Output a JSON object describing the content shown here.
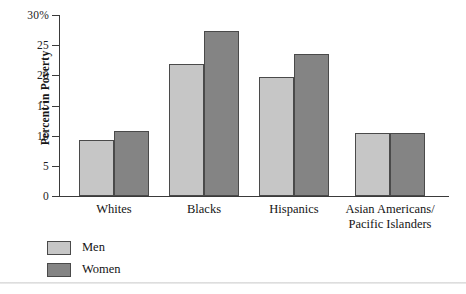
{
  "chart_data": {
    "type": "bar",
    "title": "",
    "xlabel": "",
    "ylabel": "Percent in Poverty",
    "ylim": [
      0,
      30
    ],
    "grid": false,
    "legend_position": "bottom-left",
    "y_ticks": [
      {
        "value": 30,
        "label": "30%"
      },
      {
        "value": 25,
        "label": "25"
      },
      {
        "value": 20,
        "label": "20"
      },
      {
        "value": 15,
        "label": "15"
      },
      {
        "value": 10,
        "label": "10"
      },
      {
        "value": 5,
        "label": "5"
      },
      {
        "value": 0,
        "label": "0"
      }
    ],
    "categories": [
      "Whites",
      "Blacks",
      "Hispanics",
      "Asian Americans/\nPacific Islanders"
    ],
    "category_lines": [
      [
        "Whites"
      ],
      [
        "Blacks"
      ],
      [
        "Hispanics"
      ],
      [
        "Asian Americans/",
        "Pacific Islanders"
      ]
    ],
    "series": [
      {
        "name": "Men",
        "color": "#c6c6c6",
        "values": [
          9.3,
          21.9,
          19.7,
          10.5
        ]
      },
      {
        "name": "Women",
        "color": "#848484",
        "values": [
          10.8,
          27.4,
          23.6,
          10.4
        ]
      }
    ]
  },
  "legend": {
    "items": [
      {
        "label": "Men",
        "swatch": "men"
      },
      {
        "label": "Women",
        "swatch": "women"
      }
    ]
  },
  "colors": {
    "men_fill": "#c6c6c6",
    "women_fill": "#848484",
    "bar_stroke": "#4a4a4a",
    "axis": "#3a3a3a",
    "text": "#141414",
    "background": "#ffffff"
  }
}
